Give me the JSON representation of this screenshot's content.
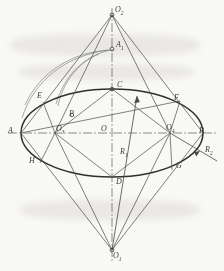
{
  "diagram": {
    "stroke_color": "#4a4a4a",
    "stroke_color_light": "#7e7e7e",
    "background": "#fdfdfb",
    "labels": [
      {
        "id": "O2",
        "text": "O",
        "sub": "2",
        "x": 115,
        "y": 6,
        "name": "point-label-o2"
      },
      {
        "id": "A1",
        "text": "A",
        "sub": "1",
        "x": 116,
        "y": 41,
        "name": "point-label-a1"
      },
      {
        "id": "C",
        "text": "C",
        "sub": "",
        "x": 117,
        "y": 81,
        "name": "point-label-c"
      },
      {
        "id": "E",
        "text": "E",
        "sub": "",
        "x": 37,
        "y": 92,
        "name": "point-label-e"
      },
      {
        "id": "F",
        "text": "F",
        "sub": "",
        "x": 174,
        "y": 94,
        "name": "point-label-f"
      },
      {
        "id": "P",
        "text": "P",
        "sub": "",
        "x": 69,
        "y": 110,
        "name": "point-label-p"
      },
      {
        "id": "A",
        "text": "A",
        "sub": "",
        "x": 8,
        "y": 127,
        "name": "point-label-a"
      },
      {
        "id": "O3",
        "text": "O",
        "sub": "3",
        "x": 56,
        "y": 125,
        "name": "point-label-o3"
      },
      {
        "id": "O",
        "text": "O",
        "sub": "",
        "x": 101,
        "y": 125,
        "name": "point-label-o"
      },
      {
        "id": "O4",
        "text": "O",
        "sub": "4",
        "x": 166,
        "y": 124,
        "name": "point-label-o4"
      },
      {
        "id": "B",
        "text": "B",
        "sub": "",
        "x": 199,
        "y": 127,
        "name": "point-label-b"
      },
      {
        "id": "R2",
        "text": "R",
        "sub": "2",
        "x": 205,
        "y": 146,
        "name": "radius-label-r2"
      },
      {
        "id": "R1",
        "text": "R",
        "sub": "1",
        "x": 120,
        "y": 148,
        "name": "radius-label-r1"
      },
      {
        "id": "H",
        "text": "H",
        "sub": "",
        "x": 29,
        "y": 157,
        "name": "point-label-h"
      },
      {
        "id": "G",
        "text": "G",
        "sub": "",
        "x": 176,
        "y": 162,
        "name": "point-label-g"
      },
      {
        "id": "D",
        "text": "D",
        "sub": "",
        "x": 116,
        "y": 178,
        "name": "point-label-d"
      },
      {
        "id": "O1",
        "text": "O",
        "sub": "1",
        "x": 113,
        "y": 252,
        "name": "point-label-o1"
      }
    ],
    "points": {
      "O2": [
        112,
        15
      ],
      "A1": [
        112,
        49
      ],
      "C": [
        112,
        89
      ],
      "E": [
        43,
        102
      ],
      "F": [
        180,
        101
      ],
      "P": [
        72,
        115
      ],
      "A": [
        21,
        133
      ],
      "O3": [
        55,
        133
      ],
      "O": [
        112,
        133
      ],
      "O4": [
        170,
        133
      ],
      "B": [
        203,
        133
      ],
      "H": [
        40,
        163
      ],
      "G": [
        172,
        170
      ],
      "D": [
        112,
        177
      ],
      "O1": [
        112,
        250
      ]
    }
  }
}
